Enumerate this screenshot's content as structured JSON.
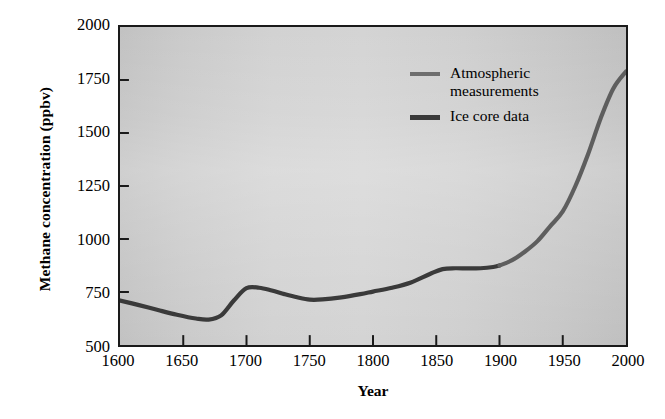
{
  "chart_data": {
    "type": "line",
    "title": "",
    "xlabel": "Year",
    "ylabel": "Methane concentration (ppbv)",
    "xlim": [
      1600,
      2000
    ],
    "ylim": [
      500,
      2000
    ],
    "grid": false,
    "legend_position": "upper-center-right",
    "x_ticks": [
      "1600",
      "1650",
      "1700",
      "1750",
      "1800",
      "1850",
      "1900",
      "1950",
      "2000"
    ],
    "y_ticks": [
      "500",
      "750",
      "1000",
      "1250",
      "1500",
      "1750",
      "2000"
    ],
    "series": [
      {
        "name": "Ice core data",
        "color": "#3a3a3a",
        "x": [
          1600,
          1615,
          1630,
          1645,
          1660,
          1670,
          1680,
          1690,
          1700,
          1710,
          1720,
          1730,
          1740,
          1750,
          1760,
          1775,
          1790,
          1800,
          1815,
          1830,
          1845,
          1855,
          1865,
          1875,
          1885,
          1895,
          1900
        ],
        "values": [
          710,
          688,
          665,
          643,
          625,
          620,
          640,
          710,
          768,
          770,
          757,
          740,
          725,
          714,
          715,
          725,
          740,
          752,
          770,
          795,
          835,
          858,
          862,
          861,
          862,
          868,
          875
        ]
      },
      {
        "name": "Atmospheric measurements",
        "color": "#5e5e5e",
        "x": [
          1900,
          1910,
          1920,
          1930,
          1940,
          1950,
          1960,
          1970,
          1980,
          1990,
          2000
        ],
        "values": [
          875,
          900,
          940,
          990,
          1060,
          1130,
          1250,
          1400,
          1570,
          1710,
          1790
        ]
      }
    ]
  },
  "axes": {
    "y_title": "Methane concentration (ppbv)",
    "x_title": "Year",
    "y_ticks": [
      {
        "label": "2000",
        "value": 2000
      },
      {
        "label": "1750",
        "value": 1750
      },
      {
        "label": "1500",
        "value": 1500
      },
      {
        "label": "1250",
        "value": 1250
      },
      {
        "label": "1000",
        "value": 1000
      },
      {
        "label": "750",
        "value": 750
      },
      {
        "label": "500",
        "value": 500
      }
    ],
    "x_ticks": [
      {
        "label": "1600",
        "value": 1600
      },
      {
        "label": "1650",
        "value": 1650
      },
      {
        "label": "1700",
        "value": 1700
      },
      {
        "label": "1750",
        "value": 1750
      },
      {
        "label": "1800",
        "value": 1800
      },
      {
        "label": "1850",
        "value": 1850
      },
      {
        "label": "1900",
        "value": 1900
      },
      {
        "label": "1950",
        "value": 1950
      },
      {
        "label": "2000",
        "value": 2000
      }
    ]
  },
  "legend": {
    "entries": [
      {
        "label": "Atmospheric measurements",
        "color": "#6e6e6e",
        "style": "atmospheric"
      },
      {
        "label": "Ice core data",
        "color": "#3a3a3a",
        "style": "icecore"
      }
    ]
  },
  "colors": {
    "plot_background": "#cccccc",
    "frame": "#1a1a1a",
    "page_background": "#ffffff",
    "ice_core_line": "#3a3a3a",
    "atmospheric_line": "#5e5e5e"
  }
}
